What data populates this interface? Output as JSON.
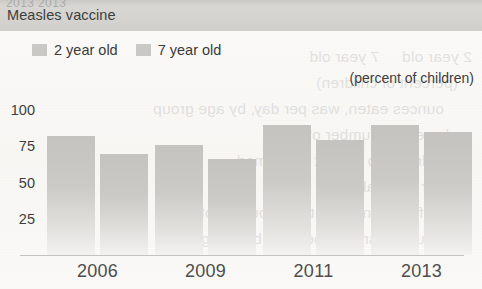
{
  "page": {
    "clipped_top_text": "2013 2013",
    "header_title": "Measles vaccine",
    "units_label": "(percent of children)",
    "band_color": "#d4d3cf",
    "bar_color": "#c8c7c4",
    "text_color": "#3d3d3d",
    "bleed_lines": [
      "2 year old     7 year old",
      "(percent of children)",
      "ounces eaten, was per day, by age group",
      "and average number of",
      "Children 2 to 19 that consumed",
      "per day. Table 7.",
      "Snack foods and vegetables burden of",
      "consuming snacks per day, by age group"
    ]
  },
  "legend": {
    "items": [
      {
        "label": "2 year old",
        "swatch": "legend-swatch",
        "color": "#c9c8c5"
      },
      {
        "label": "7 year old",
        "swatch": "legend-swatch",
        "color": "#c9c8c5"
      }
    ]
  },
  "chart_data": {
    "type": "bar",
    "title": "Measles vaccine",
    "xlabel": "",
    "ylabel": "",
    "units": "(percent of children)",
    "categories": [
      "2006",
      "2009",
      "2011",
      "2013"
    ],
    "series": [
      {
        "name": "2 year old",
        "values": [
          82,
          76,
          90,
          90
        ]
      },
      {
        "name": "7 year old",
        "values": [
          70,
          66,
          79,
          85
        ]
      }
    ],
    "ylim": [
      0,
      100
    ],
    "yticks": [
      100,
      75,
      50,
      25
    ],
    "grid": false,
    "legend_position": "top-left"
  }
}
